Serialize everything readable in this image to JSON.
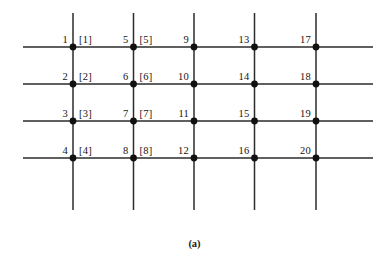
{
  "figure": {
    "caption": "(a)",
    "caption_x": 0,
    "caption_y": 238,
    "width": 389,
    "height": 267,
    "background_color": "#ffffff",
    "line_color": "#2b2b2b",
    "node_color": "#111111",
    "text_color": "#151515"
  },
  "geometry": {
    "column_x": [
      73,
      133.5,
      194,
      254.5,
      316
    ],
    "row_y": [
      47,
      84,
      121,
      158
    ],
    "vertical_line_top": 13,
    "vertical_line_bottom": 210,
    "horizontal_line_left": 23,
    "horizontal_line_right": 373,
    "node_radius": 3.4,
    "line_width": 1.5
  },
  "nodes": [
    {
      "id": 1,
      "label": "1",
      "col": 0,
      "row": 0,
      "x": 73,
      "y": 47,
      "bracket": "[1]"
    },
    {
      "id": 2,
      "label": "2",
      "col": 0,
      "row": 1,
      "x": 73,
      "y": 84,
      "bracket": "[2]"
    },
    {
      "id": 3,
      "label": "3",
      "col": 0,
      "row": 2,
      "x": 73,
      "y": 121,
      "bracket": "[3]"
    },
    {
      "id": 4,
      "label": "4",
      "col": 0,
      "row": 3,
      "x": 73,
      "y": 158,
      "bracket": "[4]"
    },
    {
      "id": 5,
      "label": "5",
      "col": 1,
      "row": 0,
      "x": 133.5,
      "y": 47,
      "bracket": "[5]"
    },
    {
      "id": 6,
      "label": "6",
      "col": 1,
      "row": 1,
      "x": 133.5,
      "y": 84,
      "bracket": "[6]"
    },
    {
      "id": 7,
      "label": "7",
      "col": 1,
      "row": 2,
      "x": 133.5,
      "y": 121,
      "bracket": "[7]"
    },
    {
      "id": 8,
      "label": "8",
      "col": 1,
      "row": 3,
      "x": 133.5,
      "y": 158,
      "bracket": "[8]"
    },
    {
      "id": 9,
      "label": "9",
      "col": 2,
      "row": 0,
      "x": 194,
      "y": 47,
      "bracket": ""
    },
    {
      "id": 10,
      "label": "10",
      "col": 2,
      "row": 1,
      "x": 194,
      "y": 84,
      "bracket": ""
    },
    {
      "id": 11,
      "label": "11",
      "col": 2,
      "row": 2,
      "x": 194,
      "y": 121,
      "bracket": ""
    },
    {
      "id": 12,
      "label": "12",
      "col": 2,
      "row": 3,
      "x": 194,
      "y": 158,
      "bracket": ""
    },
    {
      "id": 13,
      "label": "13",
      "col": 3,
      "row": 0,
      "x": 254.5,
      "y": 47,
      "bracket": ""
    },
    {
      "id": 14,
      "label": "14",
      "col": 3,
      "row": 1,
      "x": 254.5,
      "y": 84,
      "bracket": ""
    },
    {
      "id": 15,
      "label": "15",
      "col": 3,
      "row": 2,
      "x": 254.5,
      "y": 121,
      "bracket": ""
    },
    {
      "id": 16,
      "label": "16",
      "col": 3,
      "row": 3,
      "x": 254.5,
      "y": 158,
      "bracket": ""
    },
    {
      "id": 17,
      "label": "17",
      "col": 4,
      "row": 0,
      "x": 316,
      "y": 47,
      "bracket": ""
    },
    {
      "id": 18,
      "label": "18",
      "col": 4,
      "row": 1,
      "x": 316,
      "y": 84,
      "bracket": ""
    },
    {
      "id": 19,
      "label": "19",
      "col": 4,
      "row": 2,
      "x": 316,
      "y": 121,
      "bracket": ""
    },
    {
      "id": 20,
      "label": "20",
      "col": 4,
      "row": 3,
      "x": 316,
      "y": 158,
      "bracket": ""
    }
  ]
}
